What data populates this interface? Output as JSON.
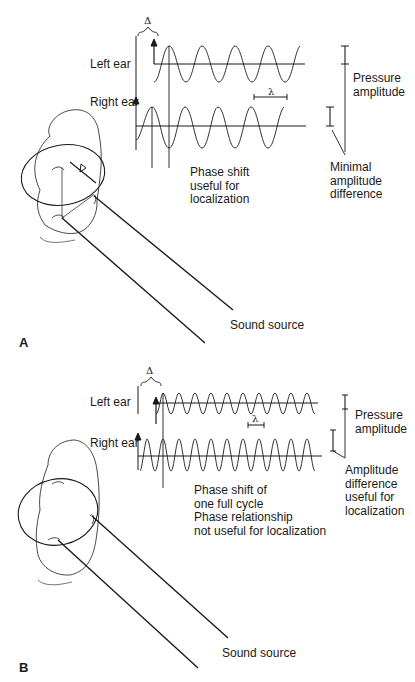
{
  "figure": {
    "panels": [
      {
        "id": "A",
        "letter": "A",
        "left_ear_label": "Left ear",
        "right_ear_label": "Right ear",
        "delta_label": "Δ",
        "lambda_label": "λ",
        "phase_note": [
          "Phase shift",
          "useful for",
          "localization"
        ],
        "pressure_label": [
          "Pressure",
          "amplitude"
        ],
        "amplitude_note": [
          "Minimal",
          "amplitude",
          "difference"
        ],
        "sound_source_label": "Sound source",
        "head_delta_label": "Δ"
      },
      {
        "id": "B",
        "letter": "B",
        "left_ear_label": "Left ear",
        "right_ear_label": "Right ear",
        "delta_label": "Δ",
        "lambda_label": "λ",
        "phase_note": [
          "Phase shift of",
          "one full cycle",
          "Phase relationship",
          "not useful for localization"
        ],
        "pressure_label": [
          "Pressure",
          "amplitude"
        ],
        "amplitude_note": [
          "Amplitude",
          "difference",
          "useful for",
          "localization"
        ],
        "sound_source_label": "Sound source"
      }
    ],
    "colors": {
      "ink": "#1a1a1a",
      "background": "#ffffff"
    }
  }
}
